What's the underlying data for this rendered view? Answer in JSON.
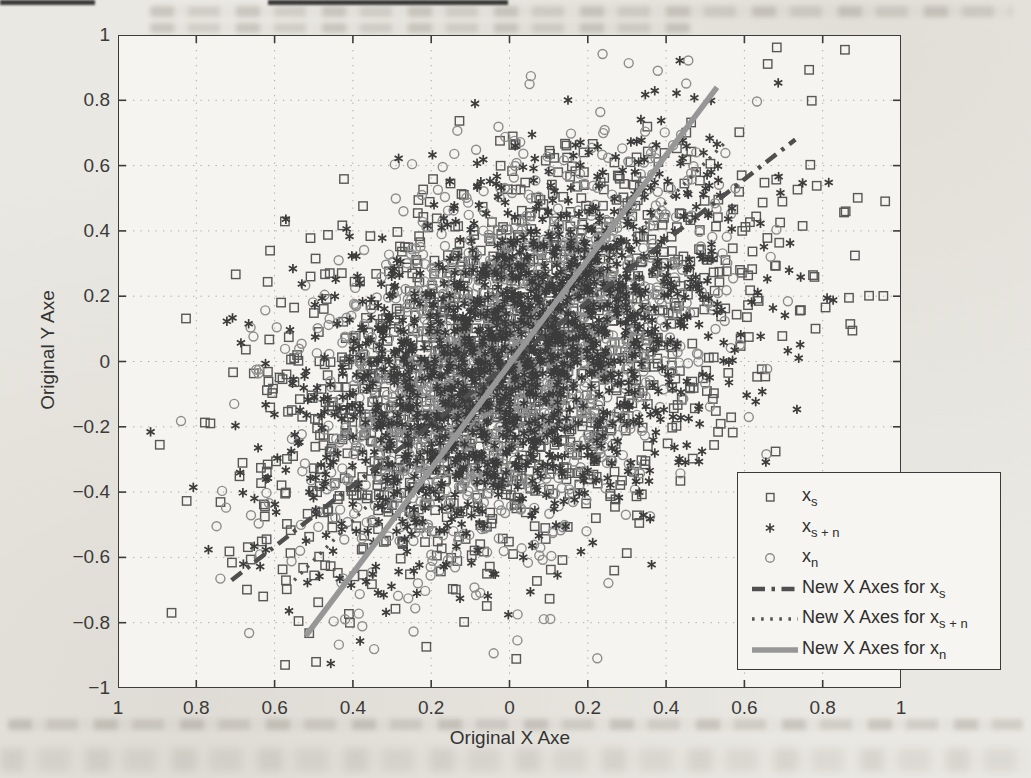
{
  "chart_data": {
    "type": "scatter",
    "title": "",
    "xlabel": "Original X Axe",
    "ylabel": "Original Y Axe",
    "xlim": [
      -1,
      1
    ],
    "ylim": [
      -1,
      1
    ],
    "grid": true,
    "grid_style": "dotted",
    "legend_position": "lower-right",
    "axis_color": "#3c3c3c",
    "grid_color": "#a9a9a9",
    "tick_text_color": "#3a3a3a",
    "x_ticks": [
      -1,
      -0.8,
      -0.6,
      -0.4,
      -0.2,
      0,
      0.2,
      0.4,
      0.6,
      0.8,
      1
    ],
    "x_tick_labels": [
      "1",
      "0.8",
      "0.6",
      "0.4",
      "0.2",
      "0",
      "0.2",
      "0.4",
      "0.6",
      "0.8",
      "1"
    ],
    "y_ticks": [
      1,
      0.8,
      0.6,
      0.4,
      0.2,
      0,
      -0.2,
      -0.4,
      -0.6,
      -0.8,
      -1
    ],
    "y_tick_labels": [
      "1",
      "0.8",
      "0.6",
      "0.4",
      "0.2",
      "0",
      "−0.2",
      "−0.4",
      "−0.6",
      "−0.8",
      "−1"
    ],
    "series": [
      {
        "name": "x_s",
        "marker": "square",
        "color": "#585858",
        "n": 1500,
        "center": [
          0,
          0
        ],
        "axis_angle_deg": 43,
        "sigma_major": 0.37,
        "sigma_minor": 0.24,
        "seed": 11
      },
      {
        "name": "x_s+n",
        "marker": "star",
        "color": "#3c3c3c",
        "n": 1500,
        "center": [
          0,
          0
        ],
        "axis_angle_deg": 50,
        "sigma_major": 0.33,
        "sigma_minor": 0.215,
        "seed": 23
      },
      {
        "name": "x_n",
        "marker": "circle",
        "color": "#8d8d8d",
        "n": 1500,
        "center": [
          0,
          0
        ],
        "axis_angle_deg": 58,
        "sigma_major": 0.33,
        "sigma_minor": 0.205,
        "seed": 37
      }
    ],
    "lines": [
      {
        "name": "New X Axes for x_s",
        "style": "dashdot",
        "color": "#4f4f4f",
        "width": 4.5,
        "from": [
          -0.71,
          -0.67
        ],
        "to": [
          0.73,
          0.68
        ]
      },
      {
        "name": "New X Axes for x_s+n",
        "style": "dotted",
        "color": "#555555",
        "width": 3.5,
        "from": [
          -0.55,
          -0.67
        ],
        "to": [
          0.55,
          0.67
        ]
      },
      {
        "name": "New X Axes for x_n",
        "style": "solid",
        "color": "#979797",
        "width": 5.5,
        "from": [
          -0.52,
          -0.84
        ],
        "to": [
          0.53,
          0.84
        ]
      }
    ],
    "legend": {
      "rows": [
        {
          "kind": "marker",
          "marker": "square",
          "base": "x",
          "sub": "s"
        },
        {
          "kind": "marker",
          "marker": "star",
          "base": "x",
          "sub": "s + n"
        },
        {
          "kind": "marker",
          "marker": "circle",
          "base": "x",
          "sub": "n"
        },
        {
          "kind": "line",
          "style": "dashdot",
          "base": "New X Axes for x",
          "sub": "s"
        },
        {
          "kind": "line",
          "style": "dotted",
          "base": "New X Axes for x",
          "sub": "s + n"
        },
        {
          "kind": "line",
          "style": "solid",
          "base": "New X Axes for x",
          "sub": "n"
        }
      ]
    }
  }
}
